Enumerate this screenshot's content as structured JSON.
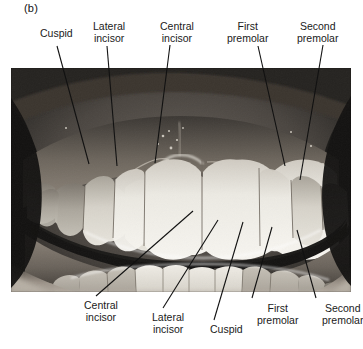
{
  "figure": {
    "panel_letter": "(b)",
    "type": "labeled-photograph",
    "color_mode": "grayscale"
  },
  "top_labels": [
    {
      "name": "cuspid",
      "line1": "Cuspid",
      "line2": "",
      "x": 40,
      "y": 28
    },
    {
      "name": "lateral-incisor",
      "line1": "Lateral",
      "line2": "incisor",
      "x": 93,
      "y": 21
    },
    {
      "name": "central-incisor",
      "line1": "Central",
      "line2": "incisor",
      "x": 160,
      "y": 21
    },
    {
      "name": "first-premolar",
      "line1": "First",
      "line2": "premolar",
      "x": 227,
      "y": 21
    },
    {
      "name": "second-premolar",
      "line1": "Second",
      "line2": "premolar",
      "x": 297,
      "y": 21
    }
  ],
  "bottom_labels": [
    {
      "name": "central-incisor",
      "line1": "Central",
      "line2": "incisor",
      "x": 84,
      "y": 300
    },
    {
      "name": "lateral-incisor",
      "line1": "Lateral",
      "line2": "incisor",
      "x": 152,
      "y": 312
    },
    {
      "name": "cuspid",
      "line1": "Cuspid",
      "line2": "",
      "x": 210,
      "y": 324
    },
    {
      "name": "first-premolar",
      "line1": "First",
      "line2": "premolar",
      "x": 257,
      "y": 303
    },
    {
      "name": "second-premolar",
      "line1": "Second",
      "line2": "premolar",
      "x": 322,
      "y": 303
    }
  ],
  "leader_lines": {
    "color": "#111111",
    "width": 1.1,
    "top": [
      {
        "name": "leader-cuspid-upper",
        "x1": 57,
        "y1": 46,
        "x2": 89,
        "y2": 164
      },
      {
        "name": "leader-lateral-incisor-upper",
        "x1": 107,
        "y1": 46,
        "x2": 117,
        "y2": 166
      },
      {
        "name": "leader-central-incisor-upper",
        "x1": 170,
        "y1": 45,
        "x2": 155,
        "y2": 163
      },
      {
        "name": "leader-first-premolar-upper",
        "x1": 258,
        "y1": 46,
        "x2": 285,
        "y2": 166
      },
      {
        "name": "leader-second-premolar-upper",
        "x1": 323,
        "y1": 45,
        "x2": 300,
        "y2": 180
      }
    ],
    "bottom": [
      {
        "name": "leader-central-incisor-lower",
        "x1": 193,
        "y1": 211,
        "x2": 96,
        "y2": 296
      },
      {
        "name": "leader-lateral-incisor-lower",
        "x1": 218,
        "y1": 220,
        "x2": 163,
        "y2": 308
      },
      {
        "name": "leader-cuspid-lower",
        "x1": 243,
        "y1": 222,
        "x2": 214,
        "y2": 320
      },
      {
        "name": "leader-first-premolar-lower",
        "x1": 272,
        "y1": 227,
        "x2": 252,
        "y2": 298
      },
      {
        "name": "leader-second-premolar-lower",
        "x1": 297,
        "y1": 230,
        "x2": 316,
        "y2": 298
      }
    ]
  },
  "photo": {
    "x": 11,
    "y": 68,
    "width": 340,
    "height": 224,
    "palette": {
      "background_dark": "#1e1e1e",
      "oral_mucosa_mid": "#4a4643",
      "gingiva": "#8b8279",
      "enamel_bright": "#e9e6df",
      "enamel_mid": "#cbc7c0",
      "enamel_shadow": "#a9a49c",
      "interocclusal_dark": "#201f1d",
      "lip_light": "#b4ada3",
      "highlight": "#f6f4ef"
    },
    "upper_teeth": [
      {
        "name": "upper-left-second-premolar",
        "x": 28,
        "w": 30,
        "h": 40,
        "tone": "enamel_shadow"
      },
      {
        "name": "upper-left-first-premolar",
        "x": 55,
        "w": 30,
        "h": 48,
        "tone": "enamel_mid"
      },
      {
        "name": "upper-left-cuspid",
        "x": 84,
        "w": 34,
        "h": 60,
        "tone": "enamel_mid"
      },
      {
        "name": "upper-left-lateral-incisor",
        "x": 116,
        "w": 32,
        "h": 62,
        "tone": "enamel_bright"
      },
      {
        "name": "upper-left-central-incisor",
        "x": 146,
        "w": 44,
        "h": 78,
        "tone": "enamel_bright"
      },
      {
        "name": "upper-right-central-incisor",
        "x": 188,
        "w": 44,
        "h": 78,
        "tone": "enamel_bright"
      },
      {
        "name": "upper-right-lateral-incisor",
        "x": 230,
        "w": 32,
        "h": 62,
        "tone": "enamel_bright"
      },
      {
        "name": "upper-right-cuspid",
        "x": 260,
        "w": 34,
        "h": 58,
        "tone": "enamel_mid"
      },
      {
        "name": "upper-right-first-premolar",
        "x": 292,
        "w": 28,
        "h": 44,
        "tone": "enamel_mid"
      },
      {
        "name": "upper-right-second-premolar",
        "x": 316,
        "w": 26,
        "h": 36,
        "tone": "enamel_shadow"
      }
    ],
    "lower_teeth": [
      {
        "name": "lower-left-second-premolar",
        "x": 30,
        "w": 30,
        "h": 34,
        "tone": "enamel_shadow"
      },
      {
        "name": "lower-left-first-premolar",
        "x": 58,
        "w": 30,
        "h": 38,
        "tone": "enamel_mid"
      },
      {
        "name": "lower-left-cuspid",
        "x": 86,
        "w": 30,
        "h": 42,
        "tone": "enamel_mid"
      },
      {
        "name": "lower-left-lateral-incisor",
        "x": 114,
        "w": 28,
        "h": 42,
        "tone": "enamel_bright"
      },
      {
        "name": "lower-left-central-incisor",
        "x": 140,
        "w": 28,
        "h": 44,
        "tone": "enamel_bright"
      },
      {
        "name": "lower-right-central-incisor",
        "x": 166,
        "w": 28,
        "h": 44,
        "tone": "enamel_bright"
      },
      {
        "name": "lower-right-lateral-incisor",
        "x": 192,
        "w": 28,
        "h": 42,
        "tone": "enamel_bright"
      },
      {
        "name": "lower-right-cuspid",
        "x": 218,
        "w": 30,
        "h": 42,
        "tone": "enamel_mid"
      },
      {
        "name": "lower-right-first-premolar",
        "x": 246,
        "w": 30,
        "h": 38,
        "tone": "enamel_mid"
      },
      {
        "name": "lower-right-second-premolar",
        "x": 274,
        "w": 30,
        "h": 34,
        "tone": "enamel_shadow"
      }
    ]
  }
}
